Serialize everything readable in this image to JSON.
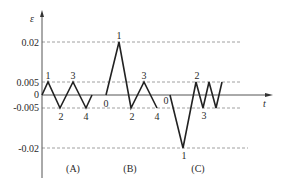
{
  "axes": {
    "y_label": "ε",
    "x_label": "t",
    "y_ticks": [
      {
        "label": "0.02",
        "value": 0.02
      },
      {
        "label": "0.005",
        "value": 0.005
      },
      {
        "label": "0",
        "value": 0
      },
      {
        "label": "-0.005",
        "value": -0.005
      },
      {
        "label": "-0.02",
        "value": -0.02
      }
    ]
  },
  "panels": [
    {
      "label": "(A)",
      "points": [
        {
          "name": "",
          "value": 0
        },
        {
          "name": "1",
          "value": 0.005
        },
        {
          "name": "2",
          "value": -0.005
        },
        {
          "name": "3",
          "value": 0.005
        },
        {
          "name": "4",
          "value": -0.005
        },
        {
          "name": "",
          "value": 0
        }
      ]
    },
    {
      "label": "(B)",
      "points": [
        {
          "name": "0",
          "value": 0
        },
        {
          "name": "1",
          "value": 0.02
        },
        {
          "name": "2",
          "value": -0.005
        },
        {
          "name": "3",
          "value": 0.005
        },
        {
          "name": "4",
          "value": -0.005
        }
      ]
    },
    {
      "label": "(C)",
      "points": [
        {
          "name": "0",
          "value": 0
        },
        {
          "name": "1",
          "value": -0.02
        },
        {
          "name": "2",
          "value": 0.005
        },
        {
          "name": "3",
          "value": -0.005
        },
        {
          "name": "",
          "value": 0.005
        },
        {
          "name": "",
          "value": -0.005
        },
        {
          "name": "",
          "value": 0.005
        }
      ]
    }
  ]
}
